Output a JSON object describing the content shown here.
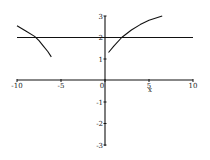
{
  "chart_data": {
    "type": "line",
    "title": "",
    "xlabel": "x",
    "ylabel": "",
    "xlim": [
      -10,
      10
    ],
    "ylim": [
      -3,
      3
    ],
    "grid": false,
    "legend": null,
    "x_ticks": [
      -10,
      -5,
      0,
      5,
      10
    ],
    "y_ticks": [
      -3,
      -2,
      -1,
      1,
      2,
      3
    ],
    "x_tick_labels": [
      "-10",
      "-5",
      "0",
      "5",
      "10"
    ],
    "y_tick_labels": [
      "-3",
      "-2",
      "-1",
      "1",
      "2",
      "3"
    ],
    "series": [
      {
        "name": "curve-left-branch",
        "x": [
          -10,
          -9,
          -8,
          -7.5,
          -7,
          -6.5,
          -6.1
        ],
        "y": [
          2.55,
          2.3,
          2.05,
          1.85,
          1.6,
          1.35,
          1.1
        ]
      },
      {
        "name": "curve-right-branch",
        "x": [
          0.4,
          1,
          1.9,
          3,
          4,
          5,
          6.5
        ],
        "y": [
          1.3,
          1.6,
          2.0,
          2.35,
          2.6,
          2.8,
          3.0
        ]
      },
      {
        "name": "horizontal-line-y2",
        "x": [
          -10,
          10
        ],
        "y": [
          2,
          2
        ]
      }
    ],
    "axis_label_x": "x"
  }
}
